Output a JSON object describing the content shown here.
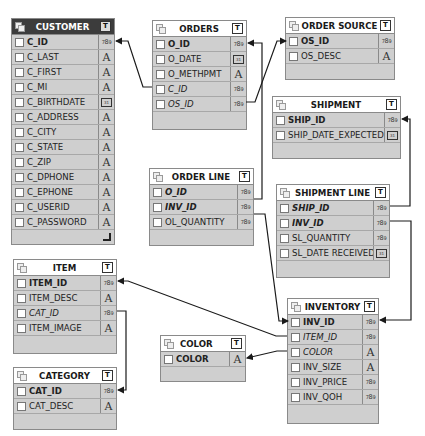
{
  "tables": {
    "customer": {
      "title": "CUSTOMER",
      "columns": [
        {
          "name": "C_ID",
          "type": "number",
          "key": "pk"
        },
        {
          "name": "C_LAST",
          "type": "text"
        },
        {
          "name": "C_FIRST",
          "type": "text"
        },
        {
          "name": "C_MI",
          "type": "text"
        },
        {
          "name": "C_BIRTHDATE",
          "type": "date"
        },
        {
          "name": "C_ADDRESS",
          "type": "text"
        },
        {
          "name": "C_CITY",
          "type": "text"
        },
        {
          "name": "C_STATE",
          "type": "text"
        },
        {
          "name": "C_ZIP",
          "type": "text"
        },
        {
          "name": "C_DPHONE",
          "type": "text"
        },
        {
          "name": "C_EPHONE",
          "type": "text"
        },
        {
          "name": "C_USERID",
          "type": "text"
        },
        {
          "name": "C_PASSWORD",
          "type": "text"
        }
      ]
    },
    "orders": {
      "title": "ORDERS",
      "columns": [
        {
          "name": "O_ID",
          "type": "number",
          "key": "pk"
        },
        {
          "name": "O_DATE",
          "type": "date"
        },
        {
          "name": "O_METHPMT",
          "type": "text"
        },
        {
          "name": "C_ID",
          "type": "number",
          "key": "fk"
        },
        {
          "name": "OS_ID",
          "type": "number",
          "key": "fk"
        }
      ]
    },
    "order_source": {
      "title": "ORDER SOURCE",
      "columns": [
        {
          "name": "OS_ID",
          "type": "number",
          "key": "pk"
        },
        {
          "name": "OS_DESC",
          "type": "text"
        }
      ]
    },
    "shipment": {
      "title": "SHIPMENT",
      "columns": [
        {
          "name": "SHIP_ID",
          "type": "number",
          "key": "pk"
        },
        {
          "name": "SHIP_DATE_EXPECTED",
          "type": "date"
        }
      ]
    },
    "order_line": {
      "title": "ORDER LINE",
      "columns": [
        {
          "name": "O_ID",
          "type": "number",
          "key": "pkfk"
        },
        {
          "name": "INV_ID",
          "type": "number",
          "key": "pkfk"
        },
        {
          "name": "OL_QUANTITY",
          "type": "number"
        }
      ]
    },
    "shipment_line": {
      "title": "SHIPMENT LINE",
      "columns": [
        {
          "name": "SHIP_ID",
          "type": "number",
          "key": "pkfk"
        },
        {
          "name": "INV_ID",
          "type": "number",
          "key": "pkfk"
        },
        {
          "name": "SL_QUANTITY",
          "type": "number"
        },
        {
          "name": "SL_DATE RECEIVED",
          "type": "date"
        }
      ]
    },
    "item": {
      "title": "ITEM",
      "columns": [
        {
          "name": "ITEM_ID",
          "type": "number",
          "key": "pk"
        },
        {
          "name": "ITEM_DESC",
          "type": "text"
        },
        {
          "name": "CAT_ID",
          "type": "number",
          "key": "fk"
        },
        {
          "name": "ITEM_IMAGE",
          "type": "text"
        }
      ]
    },
    "category": {
      "title": "CATEGORY",
      "columns": [
        {
          "name": "CAT_ID",
          "type": "number",
          "key": "pk"
        },
        {
          "name": "CAT_DESC",
          "type": "text"
        }
      ]
    },
    "color": {
      "title": "COLOR",
      "columns": [
        {
          "name": "COLOR",
          "type": "text",
          "key": "pk"
        }
      ]
    },
    "inventory": {
      "title": "INVENTORY",
      "columns": [
        {
          "name": "INV_ID",
          "type": "number",
          "key": "pk"
        },
        {
          "name": "ITEM_ID",
          "type": "number",
          "key": "fk"
        },
        {
          "name": "COLOR",
          "type": "text",
          "key": "fk"
        },
        {
          "name": "INV_SIZE",
          "type": "text"
        },
        {
          "name": "INV_PRICE",
          "type": "number"
        },
        {
          "name": "INV_QOH",
          "type": "number"
        }
      ]
    }
  },
  "icons": {
    "table_toggle": "T",
    "number_type": "789",
    "text_type": "A",
    "date_type": "31"
  },
  "colors": {
    "table_body": "#cfcfcf",
    "selected_header": "#3c3c3c",
    "connector": "#1a1a1a"
  }
}
